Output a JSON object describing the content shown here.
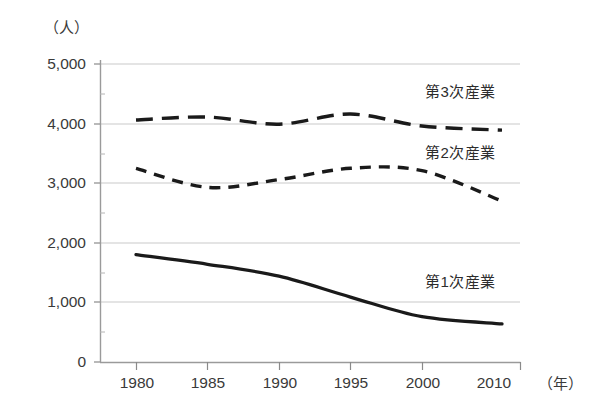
{
  "chart_data": {
    "type": "line",
    "title": "",
    "subtitle": "",
    "xlabel": "（年）",
    "ylabel": "（人）",
    "x": [
      1980,
      1985,
      1990,
      1995,
      2000,
      2010
    ],
    "xtick_labels": [
      "1980",
      "1985",
      "1990",
      "1995",
      "2000",
      "2010"
    ],
    "ytick_labels": [
      "0",
      "1,000",
      "2,000",
      "3,000",
      "4,000",
      "5,000"
    ],
    "ytick_values": [
      0,
      1000,
      2000,
      3000,
      4000,
      5000
    ],
    "ylim": [
      0,
      5000
    ],
    "y_minor_tick_step": 500,
    "grid": "horizontal",
    "legend_position": "inline-right",
    "series": [
      {
        "name": "第1次産業",
        "label": "第1次産業",
        "style": "solid",
        "color": "#1a1a1a",
        "values": [
          1800,
          1640,
          1440,
          1090,
          760,
          640
        ]
      },
      {
        "name": "第2次産業",
        "label": "第2次産業",
        "style": "short-dash",
        "color": "#1a1a1a",
        "values": [
          3250,
          2930,
          3060,
          3250,
          3210,
          2700
        ]
      },
      {
        "name": "第3次産業",
        "label": "第3次産業",
        "style": "long-dash",
        "color": "#1a1a1a",
        "values": [
          4060,
          4110,
          3990,
          4160,
          3960,
          3890
        ]
      }
    ],
    "colors": {
      "axis": "#808080",
      "gridline": "#c8c8c8",
      "line": "#1a1a1a",
      "text": "#3a3a3a",
      "background": "#ffffff"
    }
  }
}
